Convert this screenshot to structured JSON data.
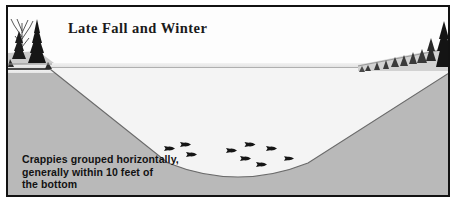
{
  "figure": {
    "title": "Late Fall and Winter",
    "caption_lines": [
      "Crappies grouped horizontally,",
      "generally within 10 feet of",
      "the bottom"
    ],
    "type": "lake cross-section illustration",
    "colors": {
      "frame": "#121212",
      "sky": "#fdfdfd",
      "ground": "#b9b9b9",
      "water": "#f4f4f4",
      "waterline": "#4b4b4b",
      "fish": "#151515",
      "text": "#121212"
    },
    "scene": {
      "left_shore_label": "left shoreline with conifer and bare trees",
      "right_shore_label": "right shoreline with receding conifer treeline",
      "surface_label": "lake surface waterline",
      "basin_label": "lake basin cross-section",
      "school_label": "school of crappies near bottom",
      "fish_count": 9
    },
    "fish": [
      {
        "x": 156,
        "y": 130,
        "s": 1.0
      },
      {
        "x": 172,
        "y": 126,
        "s": 1.0
      },
      {
        "x": 178,
        "y": 136,
        "s": 1.0
      },
      {
        "x": 218,
        "y": 132,
        "s": 1.0
      },
      {
        "x": 232,
        "y": 140,
        "s": 1.0
      },
      {
        "x": 236,
        "y": 126,
        "s": 1.05
      },
      {
        "x": 248,
        "y": 146,
        "s": 1.0
      },
      {
        "x": 258,
        "y": 130,
        "s": 1.0
      },
      {
        "x": 276,
        "y": 140,
        "s": 0.95
      }
    ]
  }
}
